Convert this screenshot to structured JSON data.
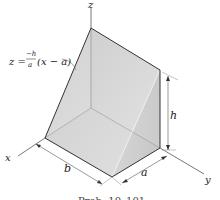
{
  "figure": {
    "equation": {
      "lhs": "z =",
      "numerator": "−h",
      "denominator": "a",
      "rhs": "(x − a)"
    },
    "axes": {
      "x": "x",
      "y": "y",
      "z": "z"
    },
    "dimensions": {
      "b": "b",
      "a": "a",
      "h": "h"
    },
    "caption": "Prob. 10–101",
    "colors": {
      "face_light": "#e9e9e9",
      "face_mid": "#d4d4d4",
      "face_dark": "#bdbdbd",
      "edge": "#333333",
      "axis": "#555555"
    }
  }
}
